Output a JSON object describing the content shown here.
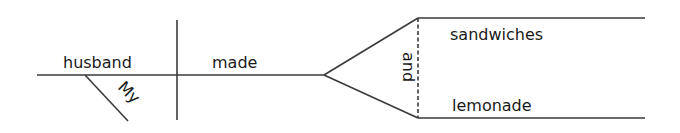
{
  "diagram": {
    "type": "sentence-diagram",
    "sentence": "My husband made sandwiches and lemonade.",
    "subject": "husband",
    "subject_modifier": "My",
    "verb": "made",
    "conjunction": "and",
    "direct_objects": [
      "sandwiches",
      "lemonade"
    ],
    "line_color": "#3a3a3a",
    "text_color": "#1a1a1a"
  }
}
